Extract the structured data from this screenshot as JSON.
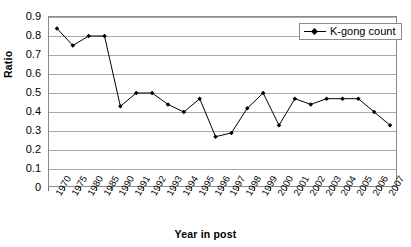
{
  "chart_data": {
    "type": "line",
    "title": "",
    "xlabel": "Year in post",
    "ylabel": "Ratio",
    "ylim": [
      0,
      0.9
    ],
    "ytick_step": 0.1,
    "grid": true,
    "legend_position": "top-right",
    "marker": "diamond",
    "line_color": "#000000",
    "marker_color": "#000000",
    "gridline_color": "#a9a9a9",
    "plot_border_color": "#8a8a8a",
    "background_color": "#ffffff",
    "categories": [
      "1970",
      "1975",
      "1980",
      "1985",
      "1990",
      "1991",
      "1992",
      "1993",
      "1994",
      "1995",
      "1996",
      "1997",
      "1998",
      "1999",
      "2000",
      "2001",
      "2002",
      "2003",
      "2004",
      "2005",
      "2006",
      "2007"
    ],
    "ytick_labels": [
      "0.9",
      "0.8",
      "0.7",
      "0.6",
      "0.5",
      "0.4",
      "0.3",
      "0.2",
      "0.1",
      "0"
    ],
    "ytick_values": [
      0.9,
      0.8,
      0.7,
      0.6,
      0.5,
      0.4,
      0.3,
      0.2,
      0.1,
      0
    ],
    "series": [
      {
        "name": "K-gong count",
        "values": [
          0.84,
          0.75,
          0.8,
          0.8,
          0.43,
          0.5,
          0.5,
          0.44,
          0.4,
          0.47,
          0.27,
          0.29,
          0.42,
          0.5,
          0.33,
          0.47,
          0.44,
          0.47,
          0.47,
          0.47,
          0.4,
          0.33
        ]
      }
    ],
    "legend": [
      {
        "label": "K-gong count"
      }
    ]
  }
}
